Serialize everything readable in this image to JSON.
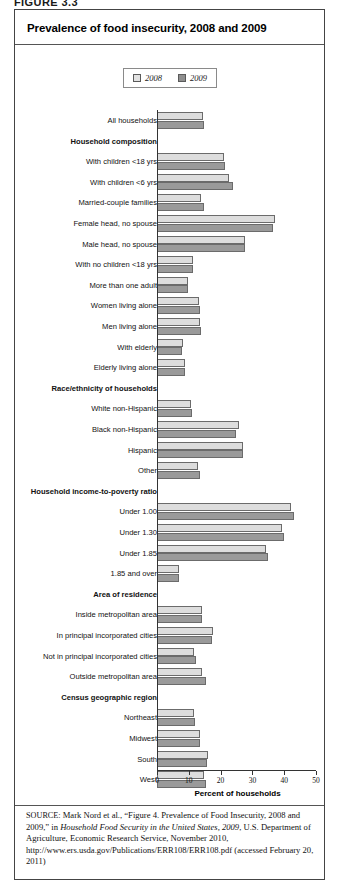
{
  "figure_label": "FIGURE 3.3",
  "chart": {
    "title": "Prevalence of food insecurity, 2008 and 2009",
    "legend": [
      {
        "label": "2008",
        "color": "#e2e2e2",
        "swatch": "legend-swatch-2008"
      },
      {
        "label": "2009",
        "color": "#8e8e8e",
        "swatch": "legend-swatch-2009"
      }
    ],
    "x_axis_title": "Percent of households",
    "x_ticks": [
      "0",
      "10",
      "20",
      "30",
      "40",
      "50"
    ]
  },
  "source": {
    "keyword": "SOURCE:",
    "text_1": " Mark Nord et al., “Figure 4. Prevalence of Food Insecurity, 2008 and 2009,” in ",
    "italic_1": "Household Food Security in the United States, 2009",
    "text_2": ", U.S. Department of Agriculture, Economic Research Service, November 2010, http://www.ers.usda.gov/Publications/ERR108/ERR108.pdf (accessed February 20, 2011)"
  },
  "chart_data": {
    "type": "bar",
    "orientation": "horizontal",
    "title": "Prevalence of food insecurity, 2008 and 2009",
    "xlabel": "Percent of households",
    "ylabel": "",
    "xlim": [
      0,
      50
    ],
    "xticks": [
      0,
      10,
      20,
      30,
      40,
      50
    ],
    "grid": false,
    "legend_position": "top-center",
    "series": [
      {
        "name": "2008",
        "color": "#e2e2e2"
      },
      {
        "name": "2009",
        "color": "#9a9a9a"
      }
    ],
    "rows": [
      {
        "kind": "data",
        "label": "All households",
        "v2008": 14.6,
        "v2009": 14.7
      },
      {
        "kind": "header",
        "label": "Household composition"
      },
      {
        "kind": "data",
        "label": "With children <18 yrs",
        "v2008": 21.0,
        "v2009": 21.3
      },
      {
        "kind": "data",
        "label": "With children <6 yrs",
        "v2008": 22.5,
        "v2009": 24.0
      },
      {
        "kind": "data",
        "label": "Married-couple families",
        "v2008": 13.9,
        "v2009": 14.7
      },
      {
        "kind": "data",
        "label": "Female head, no spouse",
        "v2008": 37.2,
        "v2009": 36.6
      },
      {
        "kind": "data",
        "label": "Male head, no spouse",
        "v2008": 27.6,
        "v2009": 27.8
      },
      {
        "kind": "data",
        "label": "With no children <18 yrs",
        "v2008": 11.3,
        "v2009": 11.4
      },
      {
        "kind": "data",
        "label": "More than one adult",
        "v2008": 9.6,
        "v2009": 9.7
      },
      {
        "kind": "data",
        "label": "Women living alone",
        "v2008": 13.2,
        "v2009": 13.5
      },
      {
        "kind": "data",
        "label": "Men living alone",
        "v2008": 13.5,
        "v2009": 13.7
      },
      {
        "kind": "data",
        "label": "With elderly",
        "v2008": 8.1,
        "v2009": 7.8
      },
      {
        "kind": "data",
        "label": "Elderly living alone",
        "v2008": 8.8,
        "v2009": 8.7
      },
      {
        "kind": "header",
        "label": "Race/ethnicity of households"
      },
      {
        "kind": "data",
        "label": "White non-Hispanic",
        "v2008": 10.7,
        "v2009": 11.0
      },
      {
        "kind": "data",
        "label": "Black non-Hispanic",
        "v2008": 25.7,
        "v2009": 24.9
      },
      {
        "kind": "data",
        "label": "Hispanic",
        "v2008": 26.9,
        "v2009": 26.9
      },
      {
        "kind": "data",
        "label": "Other",
        "v2008": 12.8,
        "v2009": 13.4
      },
      {
        "kind": "header",
        "label": "Household income-to-poverty ratio"
      },
      {
        "kind": "data",
        "label": "Under 1.00",
        "v2008": 42.2,
        "v2009": 43.0
      },
      {
        "kind": "data",
        "label": "Under 1.30",
        "v2008": 39.4,
        "v2009": 39.9
      },
      {
        "kind": "data",
        "label": "Under 1.85",
        "v2008": 34.3,
        "v2009": 35.0
      },
      {
        "kind": "data",
        "label": "1.85 and over",
        "v2008": 6.9,
        "v2009": 6.8
      },
      {
        "kind": "header",
        "label": "Area of residence"
      },
      {
        "kind": "data",
        "label": "Inside metropolitan area",
        "v2008": 14.1,
        "v2009": 14.3
      },
      {
        "kind": "data",
        "label": "In principal incorporated cities",
        "v2008": 17.7,
        "v2009": 17.2
      },
      {
        "kind": "data",
        "label": "Not in principal incorporated cities",
        "v2008": 11.6,
        "v2009": 12.4
      },
      {
        "kind": "data",
        "label": "Outside metropolitan area",
        "v2008": 14.2,
        "v2009": 15.3
      },
      {
        "kind": "header",
        "label": "Census geographic region"
      },
      {
        "kind": "data",
        "label": "Northeast",
        "v2008": 11.6,
        "v2009": 12.0
      },
      {
        "kind": "data",
        "label": "Midwest",
        "v2008": 13.6,
        "v2009": 13.6
      },
      {
        "kind": "data",
        "label": "South",
        "v2008": 16.0,
        "v2009": 15.8
      },
      {
        "kind": "data",
        "label": "West",
        "v2008": 14.9,
        "v2009": 15.4
      }
    ]
  }
}
